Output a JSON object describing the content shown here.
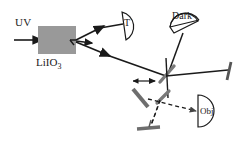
{
  "figure": {
    "background_color": "#ffffff",
    "line_color": "#1a1a1a",
    "crystal_fill": "#999999",
    "mirror_fill": "#8a8a8a",
    "width": 250,
    "height": 143
  },
  "labels": {
    "pump_beam": "UV",
    "crystal": "LiIO",
    "crystal_subscript": "3",
    "detector_t": "T",
    "detector_dark": "Dark",
    "detector_obj": "Obj"
  },
  "components": [
    {
      "name": "uv-pump-beam",
      "type": "beam",
      "label": "UV",
      "style": "solid-arrow"
    },
    {
      "name": "liio3-crystal",
      "type": "nonlinear-crystal",
      "label": "LiIO3",
      "color": "#999999"
    },
    {
      "name": "detector-t",
      "type": "detector",
      "label": "T"
    },
    {
      "name": "detector-dark",
      "type": "detector",
      "label": "Dark"
    },
    {
      "name": "detector-obj",
      "type": "detector",
      "label": "Obj"
    },
    {
      "name": "beam-splitter",
      "type": "beam-splitter",
      "label": ""
    },
    {
      "name": "translating-mirror",
      "type": "mirror",
      "label": "",
      "movable": true
    },
    {
      "name": "right-mirror",
      "type": "mirror",
      "label": ""
    },
    {
      "name": "bottom-mirror",
      "type": "mirror",
      "label": ""
    }
  ]
}
